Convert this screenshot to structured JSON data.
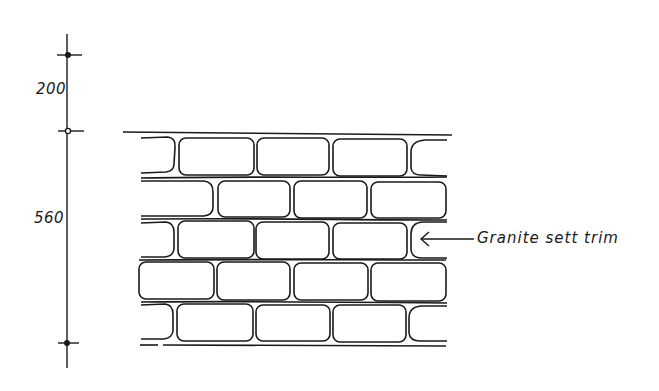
{
  "drawing": {
    "type": "elevation-detail",
    "stroke_color": "#1a1a1a",
    "background_color": "#ffffff"
  },
  "dimensions": [
    {
      "id": "upper",
      "label": "200",
      "from_y": 54,
      "to_y": 131
    },
    {
      "id": "lower",
      "label": "560",
      "from_y": 131,
      "to_y": 343
    }
  ],
  "callout": {
    "label": "Granite sett trim",
    "arrow": "left-arrow"
  },
  "wall": {
    "courses": 5,
    "rows": [
      {
        "offset": "half",
        "setts": 5
      },
      {
        "offset": "full",
        "setts": 4
      },
      {
        "offset": "half",
        "setts": 5
      },
      {
        "offset": "full",
        "setts": 4
      },
      {
        "offset": "half",
        "setts": 5
      }
    ]
  }
}
